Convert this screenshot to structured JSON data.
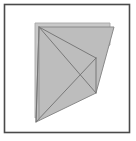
{
  "figure": {
    "background_color": "#ffffff",
    "frame": {
      "name": "outer-frame",
      "x": 4.5,
      "y": 4.5,
      "width": 125,
      "height": 128,
      "stroke_color": "#4a4a4a",
      "stroke_width": 1.6,
      "fill": "none"
    },
    "colors": {
      "paper_front_fill": "#bdbdbd",
      "paper_back_fill": "#c9c9c9",
      "paper_edge_stroke": "#8a8a8a",
      "back_layer_stroke": "#a8a8a8",
      "crease_stroke": "#707070",
      "frame_stroke": "#4a4a4a"
    },
    "shapes": [
      {
        "name": "paper-back-layer",
        "type": "polygon",
        "fill": "#c9c9c9",
        "stroke": "#a8a8a8",
        "stroke_width": 0.9,
        "points": "35,23 110,23 110,45 95,55 95,90 35,118"
      },
      {
        "name": "paper-front-layer",
        "type": "polygon",
        "fill": "#bdbdbd",
        "stroke": "#8a8a8a",
        "stroke_width": 1.0,
        "points": "39,27 114,27 96,93 36,122"
      }
    ],
    "creases": [
      {
        "name": "crease-apex-to-right-vertex",
        "x1": 39,
        "y1": 27,
        "x2": 96,
        "y2": 93,
        "stroke": "#707070",
        "stroke_width": 0.9
      },
      {
        "name": "crease-apex-to-bottom-point",
        "x1": 39,
        "y1": 27,
        "x2": 36,
        "y2": 122,
        "stroke": "#707070",
        "stroke_width": 0.9
      },
      {
        "name": "crease-apex-to-mid-right",
        "x1": 39,
        "y1": 27,
        "x2": 96,
        "y2": 58,
        "stroke": "#707070",
        "stroke_width": 0.9
      },
      {
        "name": "crease-mid-right-to-bottom-point",
        "x1": 96,
        "y1": 58,
        "x2": 36,
        "y2": 122,
        "stroke": "#707070",
        "stroke_width": 0.9
      },
      {
        "name": "crease-right-vertical-edge",
        "x1": 96,
        "y1": 58,
        "x2": 96,
        "y2": 93,
        "stroke": "#707070",
        "stroke_width": 0.9
      },
      {
        "name": "crease-left-edge-fold",
        "x1": 39,
        "y1": 27,
        "x2": 39,
        "y2": 120,
        "stroke": "#8a8a8a",
        "stroke_width": 0.8
      }
    ],
    "vertices": [
      {
        "name": "apex-top-left",
        "x": 39,
        "y": 27
      },
      {
        "name": "top-right",
        "x": 114,
        "y": 27
      },
      {
        "name": "right-mid",
        "x": 96,
        "y": 58
      },
      {
        "name": "right-vertex",
        "x": 96,
        "y": 93
      },
      {
        "name": "bottom-point",
        "x": 36,
        "y": 122
      }
    ]
  }
}
